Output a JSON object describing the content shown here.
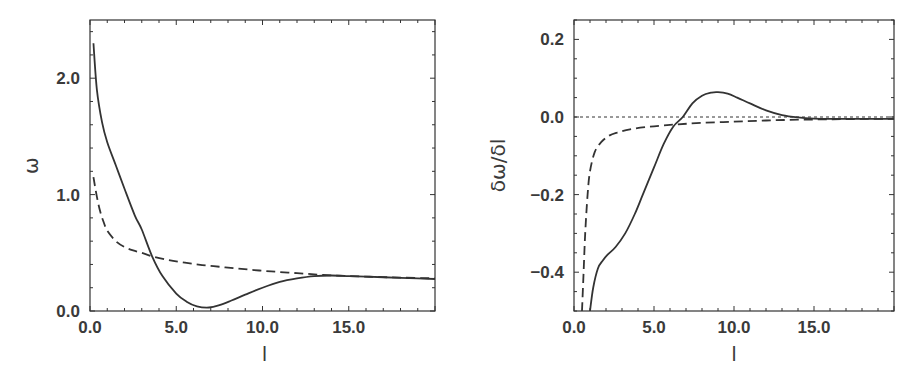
{
  "chart_data": [
    {
      "type": "line",
      "title": "",
      "xlabel": "l",
      "ylabel": "ω",
      "xlim": [
        0,
        20
      ],
      "ylim": [
        0,
        2.5
      ],
      "xticks": [
        0,
        5,
        10,
        15
      ],
      "xtick_labels": [
        "0.0",
        "5.0",
        "10.0",
        "15.0"
      ],
      "yticks": [
        0,
        1,
        2
      ],
      "ytick_labels": [
        "0.0",
        "1.0",
        "2.0"
      ],
      "grid": false,
      "legend": null,
      "series": [
        {
          "name": "solid",
          "style": "solid",
          "x": [
            0.2,
            0.4,
            0.7,
            1.0,
            1.5,
            2.0,
            2.6,
            3.0,
            3.6,
            4.2,
            5.0,
            5.6,
            6.2,
            6.9,
            7.5,
            8.2,
            9.0,
            10.0,
            11.0,
            12.0,
            13.0,
            14.0,
            15.0,
            16.0,
            17.0,
            18.0,
            19.0,
            20.0
          ],
          "y": [
            2.3,
            1.9,
            1.62,
            1.45,
            1.25,
            1.05,
            0.82,
            0.7,
            0.47,
            0.3,
            0.15,
            0.08,
            0.04,
            0.03,
            0.05,
            0.09,
            0.14,
            0.2,
            0.25,
            0.28,
            0.3,
            0.305,
            0.3,
            0.295,
            0.29,
            0.285,
            0.28,
            0.275
          ]
        },
        {
          "name": "dashed",
          "style": "dashed",
          "x": [
            0.2,
            0.4,
            0.6,
            0.8,
            1.0,
            1.5,
            2.0,
            2.5,
            3.0,
            3.6,
            4.5,
            5.5,
            6.5,
            7.5,
            8.5,
            9.5,
            10.5,
            12.0,
            13.5,
            15.0,
            16.5,
            18.0,
            20.0
          ],
          "y": [
            1.15,
            0.98,
            0.85,
            0.76,
            0.69,
            0.6,
            0.55,
            0.52,
            0.5,
            0.47,
            0.44,
            0.415,
            0.395,
            0.38,
            0.365,
            0.352,
            0.34,
            0.325,
            0.31,
            0.3,
            0.293,
            0.287,
            0.28
          ]
        }
      ]
    },
    {
      "type": "line",
      "title": "",
      "xlabel": "l",
      "ylabel": "δω/δl",
      "xlim": [
        0,
        20
      ],
      "ylim": [
        -0.5,
        0.25
      ],
      "xticks": [
        0,
        5,
        10,
        15
      ],
      "xtick_labels": [
        "0.0",
        "5.0",
        "10.0",
        "15.0"
      ],
      "yticks": [
        0.2,
        0.0,
        -0.2,
        -0.4
      ],
      "ytick_labels": [
        "0.2",
        "0.0",
        "-0.2",
        "-0.4"
      ],
      "grid": false,
      "legend": null,
      "reference_lines": [
        {
          "y": 0.0,
          "style": "dotted"
        }
      ],
      "series": [
        {
          "name": "solid",
          "style": "solid",
          "x": [
            1.0,
            1.2,
            1.5,
            1.8,
            2.1,
            2.6,
            3.2,
            3.8,
            4.3,
            5.0,
            5.6,
            6.2,
            6.8,
            7.4,
            8.0,
            8.6,
            9.0,
            9.6,
            10.2,
            11.0,
            12.0,
            13.0,
            14.0,
            15.0,
            16.0,
            18.0,
            20.0
          ],
          "y": [
            -0.5,
            -0.44,
            -0.39,
            -0.37,
            -0.355,
            -0.335,
            -0.3,
            -0.25,
            -0.2,
            -0.13,
            -0.07,
            -0.025,
            0.0,
            0.035,
            0.055,
            0.063,
            0.064,
            0.06,
            0.05,
            0.035,
            0.017,
            0.005,
            -0.001,
            -0.004,
            -0.005,
            -0.005,
            -0.005
          ]
        },
        {
          "name": "dashed",
          "style": "dashed",
          "x": [
            0.5,
            0.6,
            0.7,
            0.85,
            1.0,
            1.3,
            1.7,
            2.2,
            2.7,
            3.5,
            4.5,
            5.5,
            6.5,
            8.0,
            10.0,
            12.0,
            14.0,
            16.0,
            18.0,
            20.0
          ],
          "y": [
            -0.5,
            -0.4,
            -0.3,
            -0.2,
            -0.14,
            -0.09,
            -0.065,
            -0.048,
            -0.04,
            -0.032,
            -0.026,
            -0.022,
            -0.019,
            -0.015,
            -0.012,
            -0.009,
            -0.007,
            -0.006,
            -0.005,
            -0.005
          ]
        }
      ]
    }
  ]
}
